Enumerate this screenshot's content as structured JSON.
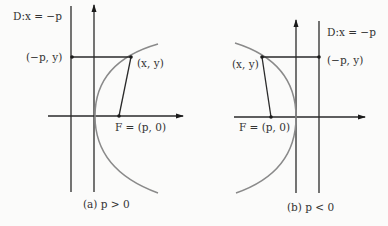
{
  "figures": [
    {
      "id": "a",
      "caption": "(a)  p > 0",
      "directrix_label": "D:x = −p",
      "point_label": "(x, y)",
      "directrix_point_label": "(−p, y)",
      "focus_label": "F = (p, 0)",
      "opens": "right"
    },
    {
      "id": "b",
      "caption": "(b)  p < 0",
      "directrix_label": "D:x = −p",
      "point_label": "(x, y)",
      "directrix_point_label": "(−p, y)",
      "focus_label": "F = (p, 0)",
      "opens": "left"
    }
  ],
  "colors": {
    "lines": "#2a2a2a",
    "parabola": "#8a8a8a",
    "text": "#333333",
    "background": "#fbfbfa"
  }
}
